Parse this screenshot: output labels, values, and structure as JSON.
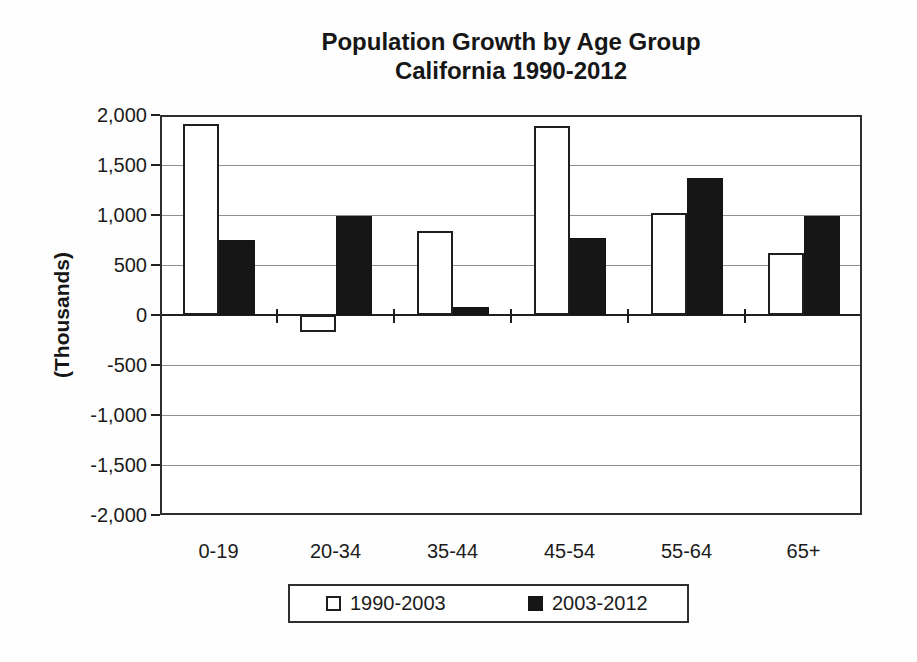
{
  "chart_data": {
    "type": "bar",
    "title": "Population Growth by Age Group",
    "subtitle": "California 1990-2012",
    "ylabel": "(Thousands)",
    "xlabel": "",
    "categories": [
      "0-19",
      "20-34",
      "35-44",
      "45-54",
      "55-64",
      "65+"
    ],
    "series": [
      {
        "name": "1990-2003",
        "color": "#ffffff",
        "border_color": "#1f1f1f",
        "values": [
          1910,
          -170,
          840,
          1890,
          1020,
          620
        ]
      },
      {
        "name": "2003-2012",
        "color": "#161616",
        "border_color": "#141414",
        "values": [
          750,
          990,
          80,
          770,
          1370,
          990
        ]
      }
    ],
    "ylim": [
      -2000,
      2000
    ],
    "ytick_step": 500,
    "ytick_labels": [
      "2,000",
      "1,500",
      "1,000",
      "500",
      "0",
      "-500",
      "-1,000",
      "-1,500",
      "-2,000"
    ],
    "grid": true,
    "legend_position": "bottom"
  },
  "colors": {
    "ink": "#1b1b1b",
    "gridline": "#8f8f8f",
    "background": "#fefefe"
  }
}
